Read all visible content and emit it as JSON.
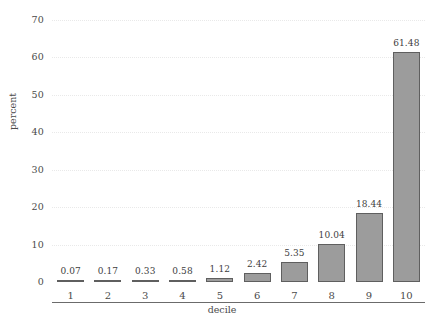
{
  "chart_data": {
    "type": "bar",
    "title": "",
    "subtitle": "",
    "xlabel": "decile",
    "ylabel": "percent",
    "categories": [
      "1",
      "2",
      "3",
      "4",
      "5",
      "6",
      "7",
      "8",
      "9",
      "10"
    ],
    "values": [
      0.07,
      0.17,
      0.33,
      0.58,
      1.12,
      2.42,
      5.35,
      10.04,
      18.44,
      61.48
    ],
    "value_labels": [
      "0.07",
      "0.17",
      "0.33",
      "0.58",
      "1.12",
      "2.42",
      "5.35",
      "10.04",
      "18.44",
      "61.48"
    ],
    "ylim": [
      0,
      70
    ],
    "yticks": [
      0,
      10,
      20,
      30,
      40,
      50,
      60,
      70
    ],
    "ytick_labels": [
      "0",
      "10",
      "20",
      "30",
      "40",
      "50",
      "60",
      "70"
    ],
    "grid": true,
    "grid_axis": "y",
    "legend": false,
    "legend_position": "none",
    "bar_fill_color": "#9c9c9c",
    "bar_edge_color": "#5f5f5f",
    "grid_color": "#e9e9e9",
    "axis_color": "#6b6b6b",
    "text_color": "#3d3d3d",
    "background_color": "#ffffff"
  }
}
